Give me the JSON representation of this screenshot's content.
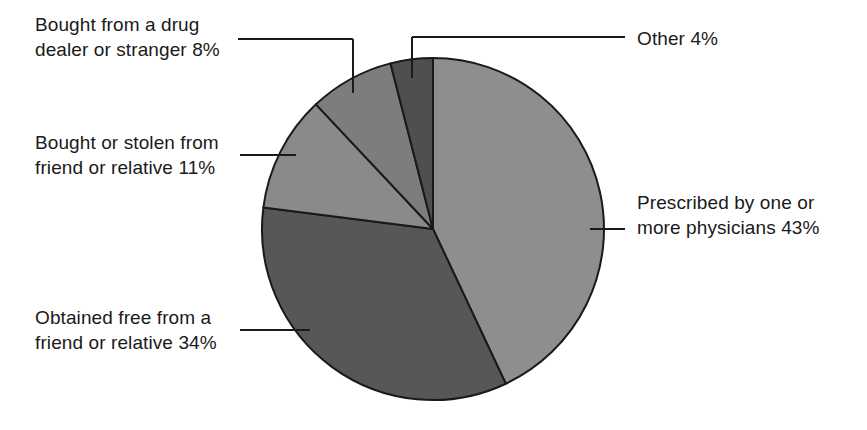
{
  "chart_data": {
    "type": "pie",
    "title": "",
    "subtitle": "",
    "xlabel": "",
    "ylabel": "",
    "legend_position": "none",
    "grid": false,
    "units": "percent",
    "start_angle_deg": 0,
    "direction": "clockwise",
    "categories": [
      "Prescribed by one or more physicians",
      "Obtained free from a friend or relative",
      "Bought or stolen from friend or relative",
      "Bought from a drug dealer or stranger",
      "Other"
    ],
    "values": [
      43,
      34,
      11,
      8,
      4
    ],
    "slices": [
      {
        "key": "prescribed",
        "category": "Prescribed by one or more physicians",
        "value": 43,
        "value_label": "43%",
        "label": "Prescribed by one or\nmore physicians 43%",
        "color": "#8e8e8e",
        "start_deg": 0,
        "end_deg": 154.8,
        "label_side": "right",
        "leader_style": "straight"
      },
      {
        "key": "obtained-free",
        "category": "Obtained free from a friend or relative",
        "value": 34,
        "value_label": "34%",
        "label": "Obtained free from a\nfriend or relative 34%",
        "color": "#575757",
        "start_deg": 154.8,
        "end_deg": 277.2,
        "label_side": "left",
        "leader_style": "straight"
      },
      {
        "key": "bought-stolen",
        "category": "Bought or stolen from friend or relative",
        "value": 11,
        "value_label": "11%",
        "label": "Bought or stolen from\nfriend or relative 11%",
        "color": "#8a8a8a",
        "start_deg": 277.2,
        "end_deg": 316.8,
        "label_side": "left",
        "leader_style": "straight"
      },
      {
        "key": "drug-dealer",
        "category": "Bought from a drug dealer or stranger",
        "value": 8,
        "value_label": "8%",
        "label": "Bought from a drug\ndealer or stranger 8%",
        "color": "#7d7d7d",
        "start_deg": 316.8,
        "end_deg": 345.6,
        "label_side": "left",
        "leader_style": "elbow"
      },
      {
        "key": "other",
        "category": "Other",
        "value": 4,
        "value_label": "4%",
        "label": "Other 4%",
        "color": "#4f4f4f",
        "start_deg": 345.6,
        "end_deg": 360,
        "label_side": "right",
        "leader_style": "elbow"
      }
    ],
    "geometry": {
      "center_x": 433,
      "center_y": 229,
      "radius": 171
    },
    "style": {
      "background": "#ffffff",
      "outline_color": "#1a1a1a",
      "leader_color": "#1a1a1a",
      "text_color": "#1a1a1a"
    }
  },
  "labels": {
    "drug_dealer": "Bought from a drug\ndealer or stranger 8%",
    "bought_stolen": "Bought or stolen from\nfriend or relative 11%",
    "obtained_free": "Obtained free from a\nfriend or relative 34%",
    "other": "Other 4%",
    "prescribed": "Prescribed by one or\nmore physicians 43%"
  }
}
